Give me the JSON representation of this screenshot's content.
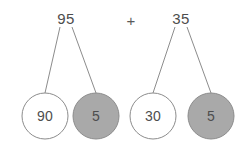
{
  "canvas": {
    "width": 250,
    "height": 148,
    "background": "#ffffff"
  },
  "colors": {
    "line": "#8c8c8c",
    "circle_stroke": "#8c8c8c",
    "circle_fill_white": "#ffffff",
    "circle_fill_gray": "#a9a9a9",
    "text": "#4d4d4d"
  },
  "expression": {
    "operator": "+",
    "left_total": "95",
    "right_total": "35"
  },
  "number_bonds": [
    {
      "total": "95",
      "total_pos": {
        "x": 66,
        "y": 18
      },
      "parts": [
        {
          "value": "90",
          "filled": false,
          "cx": 45,
          "cy": 116,
          "r": 23
        },
        {
          "value": "5",
          "filled": true,
          "cx": 96,
          "cy": 116,
          "r": 23
        }
      ],
      "branches": [
        {
          "x1": 60,
          "y1": 27,
          "x2": 45,
          "y2": 93
        },
        {
          "x1": 72,
          "y1": 27,
          "x2": 96,
          "y2": 93
        }
      ]
    },
    {
      "total": "35",
      "total_pos": {
        "x": 181,
        "y": 18
      },
      "parts": [
        {
          "value": "30",
          "filled": false,
          "cx": 153,
          "cy": 116,
          "r": 23
        },
        {
          "value": "5",
          "filled": true,
          "cx": 211,
          "cy": 116,
          "r": 23
        }
      ],
      "branches": [
        {
          "x1": 175,
          "y1": 27,
          "x2": 153,
          "y2": 93
        },
        {
          "x1": 187,
          "y1": 27,
          "x2": 211,
          "y2": 93
        }
      ]
    }
  ],
  "operator_pos": {
    "x": 131,
    "y": 20
  }
}
